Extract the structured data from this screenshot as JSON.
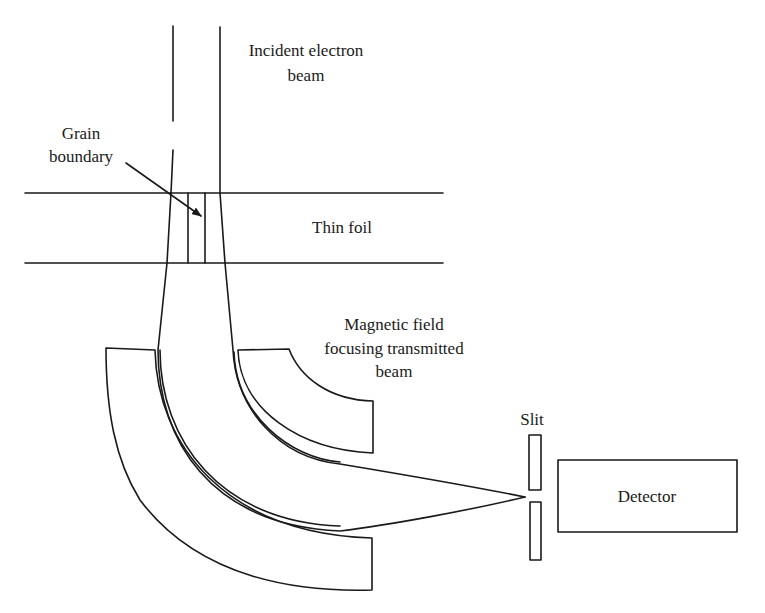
{
  "diagram": {
    "type": "schematic",
    "labels": {
      "incident_beam_line1": "Incident electron",
      "incident_beam_line2": "beam",
      "grain_boundary_line1": "Grain",
      "grain_boundary_line2": "boundary",
      "thin_foil": "Thin foil",
      "magnetic_field_line1": "Magnetic field",
      "magnetic_field_line2": "focusing transmitted",
      "magnetic_field_line3": "beam",
      "slit": "Slit",
      "detector": "Detector"
    },
    "components": [
      "incident-electron-beam",
      "thin-foil",
      "grain-boundary",
      "magnetic-pole-piece-inner",
      "magnetic-pole-piece-outer",
      "transmitted-beam",
      "slit",
      "detector"
    ],
    "colors": {
      "stroke": "#1a1a1a",
      "background": "#ffffff"
    }
  }
}
